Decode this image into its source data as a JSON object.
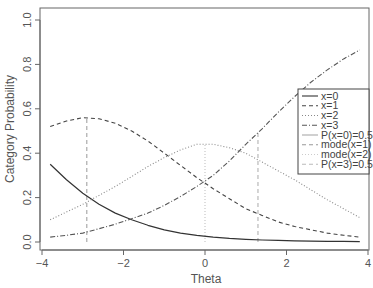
{
  "chart_data": {
    "type": "line",
    "title": "",
    "xlabel": "Theta",
    "ylabel": "Category Probability",
    "xlim": [
      -4,
      4
    ],
    "ylim": [
      0,
      1
    ],
    "x_ticks": [
      -4,
      -2,
      0,
      2,
      4
    ],
    "x_tick_labels": [
      "−4",
      "−2",
      "0",
      "2",
      "4"
    ],
    "y_ticks": [
      0.0,
      0.2,
      0.4,
      0.6,
      0.8,
      1.0
    ],
    "y_tick_labels": [
      "0.0",
      "0.2",
      "0.4",
      "0.6",
      "0.8",
      "1.0"
    ],
    "grid": false,
    "legend_position": "right",
    "x": [
      -3.8,
      -3.4,
      -3.0,
      -2.6,
      -2.2,
      -1.8,
      -1.4,
      -1.0,
      -0.6,
      -0.2,
      0.2,
      0.6,
      1.0,
      1.4,
      1.8,
      2.2,
      2.6,
      3.0,
      3.4,
      3.8
    ],
    "series": [
      {
        "name": "x=0",
        "style": "solid",
        "color": "#333333",
        "values": [
          0.35,
          0.28,
          0.22,
          0.17,
          0.13,
          0.1,
          0.075,
          0.055,
          0.04,
          0.03,
          0.022,
          0.016,
          0.012,
          0.009,
          0.007,
          0.005,
          0.004,
          0.003,
          0.0025,
          0.002
        ]
      },
      {
        "name": "x=1",
        "style": "dashed",
        "color": "#444444",
        "values": [
          0.52,
          0.545,
          0.56,
          0.555,
          0.535,
          0.5,
          0.455,
          0.4,
          0.345,
          0.29,
          0.24,
          0.195,
          0.15,
          0.12,
          0.09,
          0.07,
          0.055,
          0.04,
          0.03,
          0.022
        ]
      },
      {
        "name": "x=2",
        "style": "dotted",
        "color": "#888888",
        "values": [
          0.1,
          0.135,
          0.17,
          0.21,
          0.25,
          0.295,
          0.34,
          0.38,
          0.415,
          0.44,
          0.44,
          0.425,
          0.4,
          0.36,
          0.32,
          0.28,
          0.235,
          0.19,
          0.15,
          0.11
        ]
      },
      {
        "name": "x=3",
        "style": "dashdot",
        "color": "#555555",
        "values": [
          0.022,
          0.03,
          0.04,
          0.06,
          0.08,
          0.105,
          0.13,
          0.165,
          0.205,
          0.25,
          0.3,
          0.365,
          0.44,
          0.51,
          0.585,
          0.655,
          0.72,
          0.775,
          0.825,
          0.865
        ]
      }
    ],
    "vertical_lines": [
      {
        "name": "P(x=0)=0.5",
        "x": null,
        "style": "solid",
        "color": "#aaaaaa",
        "visible": false
      },
      {
        "name": "mode(x=1)",
        "x": -2.9,
        "style": "dashed",
        "color": "#999999"
      },
      {
        "name": "mode(x=2)",
        "x": 0.0,
        "style": "dotted",
        "color": "#bbbbbb"
      },
      {
        "name": "P(x=3)=0.5",
        "x": 1.3,
        "style": "dashed",
        "color": "#aaaaaa"
      }
    ],
    "legend": [
      {
        "label": "x=0",
        "style": "solid",
        "color": "#333333"
      },
      {
        "label": "x=1",
        "style": "dashed",
        "color": "#444444"
      },
      {
        "label": "x=2",
        "style": "dotted",
        "color": "#888888"
      },
      {
        "label": "x=3",
        "style": "dashdot",
        "color": "#555555"
      },
      {
        "label": "P(x=0)=0.5",
        "style": "solid",
        "color": "#aaaaaa"
      },
      {
        "label": "mode(x=1)",
        "style": "dashed",
        "color": "#999999"
      },
      {
        "label": "mode(x=2)",
        "style": "dotted",
        "color": "#cccccc"
      },
      {
        "label": "P(x=3)=0.5",
        "style": "dashed",
        "color": "#bbbbbb"
      }
    ]
  }
}
